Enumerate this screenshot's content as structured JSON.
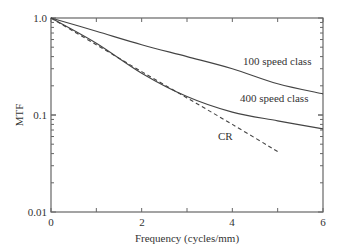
{
  "chart_data": {
    "type": "line",
    "title": "",
    "xlabel": "Frequency (cycles/mm)",
    "ylabel": "MTF",
    "xlim": [
      0,
      6
    ],
    "ylim": [
      0.01,
      1.0
    ],
    "yscale": "log",
    "grid": false,
    "legend": "inline labels",
    "x_ticks": [
      "0",
      "2",
      "4",
      "6"
    ],
    "y_ticks": [
      "0.01",
      "0.1",
      "1.0"
    ],
    "series": [
      {
        "name": "100 speed class",
        "style": "solid",
        "x": [
          0,
          1,
          2,
          3,
          4,
          5,
          6
        ],
        "values": [
          1.0,
          0.73,
          0.53,
          0.4,
          0.3,
          0.21,
          0.165
        ]
      },
      {
        "name": "400 speed class",
        "style": "solid",
        "x": [
          0,
          1,
          2,
          3,
          4,
          5,
          6
        ],
        "values": [
          1.0,
          0.55,
          0.27,
          0.155,
          0.107,
          0.087,
          0.072
        ]
      },
      {
        "name": "CR",
        "style": "dashed",
        "x": [
          0,
          1,
          2,
          3,
          4,
          5
        ],
        "values": [
          1.0,
          0.53,
          0.28,
          0.15,
          0.08,
          0.042
        ]
      }
    ]
  }
}
